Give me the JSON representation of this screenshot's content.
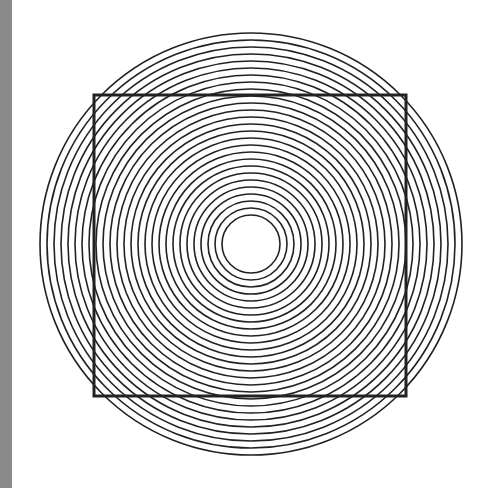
{
  "figure": {
    "type": "optical-illusion",
    "background_color": "#ffffff",
    "stroke_color": "#222222",
    "side_bar_color": "#8a8a8a",
    "circles": {
      "center_x": 251,
      "center_y": 244,
      "min_radius": 29,
      "max_radius": 213,
      "spacing": 7,
      "stroke_width": 1.6
    },
    "square": {
      "x": 94,
      "y": 95,
      "width": 312,
      "height": 301,
      "stroke_width": 3
    }
  }
}
